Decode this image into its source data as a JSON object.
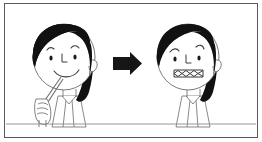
{
  "scene": {
    "title": "Eating sweets leads to toothache",
    "type": "two-panel cause-and-effect illustration",
    "background_color": "#ffffff",
    "ink_color": "#1a1a1a",
    "line_color": "#4d4d4d",
    "hair_color": "#111111",
    "frame": {
      "border_color": "#5a5a5a",
      "x": 4,
      "y": 3,
      "width": 254,
      "height": 135
    },
    "ground_line": {
      "label": "floor-line",
      "y": 124,
      "color": "#7a7a7a"
    }
  },
  "panels": [
    {
      "id": "before",
      "label": "Girl eating candy",
      "caption": "",
      "expression": "smiling",
      "mouth": "smile",
      "eyebrows": "raised",
      "holding": "candy stick",
      "center_x": 66,
      "center_y": 62
    },
    {
      "id": "after",
      "label": "Girl with toothache",
      "caption": "",
      "expression": "pained",
      "mouth": "zigzag grimace",
      "eyebrows": "drooping",
      "holding": "none",
      "center_x": 190,
      "center_y": 62
    }
  ],
  "arrow": {
    "label": "transition arrow",
    "direction": "right",
    "color": "#161616",
    "x": 113,
    "y": 52,
    "width": 29,
    "height": 23
  }
}
